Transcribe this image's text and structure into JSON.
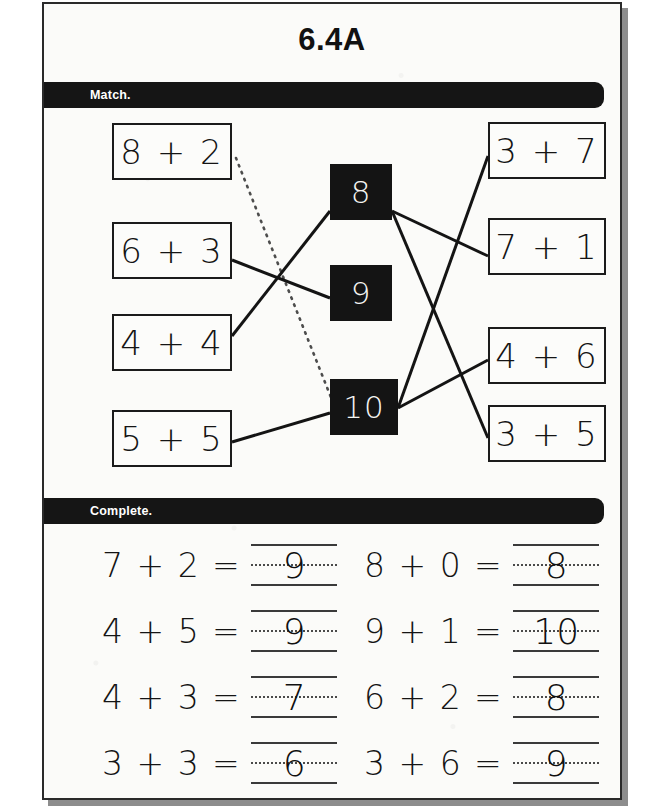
{
  "page": {
    "title": "6.4A"
  },
  "sections": {
    "match": {
      "label": "Match."
    },
    "complete": {
      "label": "Complete."
    }
  },
  "match": {
    "left_boxes": [
      {
        "id": "left-0",
        "text": "8 + 2",
        "x": 68,
        "y": 15,
        "w": 120,
        "h": 57
      },
      {
        "id": "left-1",
        "text": "6 + 3",
        "x": 68,
        "y": 114,
        "w": 120,
        "h": 57
      },
      {
        "id": "left-2",
        "text": "4 + 4",
        "x": 68,
        "y": 206,
        "w": 120,
        "h": 57
      },
      {
        "id": "left-3",
        "text": "5 + 5",
        "x": 68,
        "y": 302,
        "w": 120,
        "h": 57
      }
    ],
    "center_boxes": [
      {
        "id": "mid-8",
        "text": "8",
        "x": 286,
        "y": 56,
        "w": 62,
        "h": 56
      },
      {
        "id": "mid-9",
        "text": "9",
        "x": 286,
        "y": 157,
        "w": 62,
        "h": 56
      },
      {
        "id": "mid-10",
        "text": "10",
        "x": 286,
        "y": 271,
        "w": 68,
        "h": 56
      }
    ],
    "right_boxes": [
      {
        "id": "right-0",
        "text": "3 + 7",
        "x": 444,
        "y": 14,
        "w": 118,
        "h": 57
      },
      {
        "id": "right-1",
        "text": "7 + 1",
        "x": 444,
        "y": 110,
        "w": 118,
        "h": 57
      },
      {
        "id": "right-2",
        "text": "4 + 6",
        "x": 444,
        "y": 219,
        "w": 118,
        "h": 57
      },
      {
        "id": "right-3",
        "text": "3 + 5",
        "x": 444,
        "y": 297,
        "w": 118,
        "h": 57
      }
    ],
    "connectors": [
      {
        "id": "c-left-6p3-to-9",
        "from": "6 + 3",
        "to": "9",
        "x1": 188,
        "y1": 152,
        "x2": 286,
        "y2": 190,
        "style": "solid"
      },
      {
        "id": "c-left-4p4-to-8",
        "from": "4 + 4",
        "to": "8",
        "x1": 188,
        "y1": 228,
        "x2": 286,
        "y2": 103,
        "style": "solid"
      },
      {
        "id": "c-left-5p5-to-10",
        "from": "5 + 5",
        "to": "10",
        "x1": 188,
        "y1": 334,
        "x2": 286,
        "y2": 305,
        "style": "solid"
      },
      {
        "id": "c-left-8p2-to-10",
        "from": "8 + 2",
        "to": "10",
        "x1": 192,
        "y1": 50,
        "x2": 288,
        "y2": 292,
        "style": "dotted"
      },
      {
        "id": "c-8-to-7p1",
        "from": "8",
        "to": "7 + 1",
        "x1": 348,
        "y1": 103,
        "x2": 444,
        "y2": 148,
        "style": "solid"
      },
      {
        "id": "c-8-to-3p5",
        "from": "8",
        "to": "3 + 5",
        "x1": 348,
        "y1": 103,
        "x2": 444,
        "y2": 330,
        "style": "solid"
      },
      {
        "id": "c-10-to-3p7",
        "from": "10",
        "to": "3 + 7",
        "x1": 354,
        "y1": 300,
        "x2": 444,
        "y2": 48,
        "style": "solid"
      },
      {
        "id": "c-10-to-4p6",
        "from": "10",
        "to": "4 + 6",
        "x1": 354,
        "y1": 300,
        "x2": 444,
        "y2": 252,
        "style": "solid"
      }
    ]
  },
  "complete": {
    "rows": [
      {
        "y": 8,
        "left": {
          "prompt": "7 + 2 =",
          "answer": "9"
        },
        "right": {
          "prompt": "8 + 0 =",
          "answer": "8"
        }
      },
      {
        "y": 74,
        "left": {
          "prompt": "4 + 5 =",
          "answer": "9"
        },
        "right": {
          "prompt": "9 + 1 =",
          "answer": "10"
        }
      },
      {
        "y": 140,
        "left": {
          "prompt": "4 + 3 =",
          "answer": "7"
        },
        "right": {
          "prompt": "6 + 2 =",
          "answer": "8"
        }
      },
      {
        "y": 206,
        "left": {
          "prompt": "3 + 3 =",
          "answer": "6"
        },
        "right": {
          "prompt": "3 + 6 =",
          "answer": "9"
        }
      }
    ]
  },
  "colors": {
    "ink": "#141414",
    "paper": "#fbfbf9",
    "bar": "#151515",
    "bar_text": "#ffffff",
    "shadow": "#8d8d8d"
  }
}
